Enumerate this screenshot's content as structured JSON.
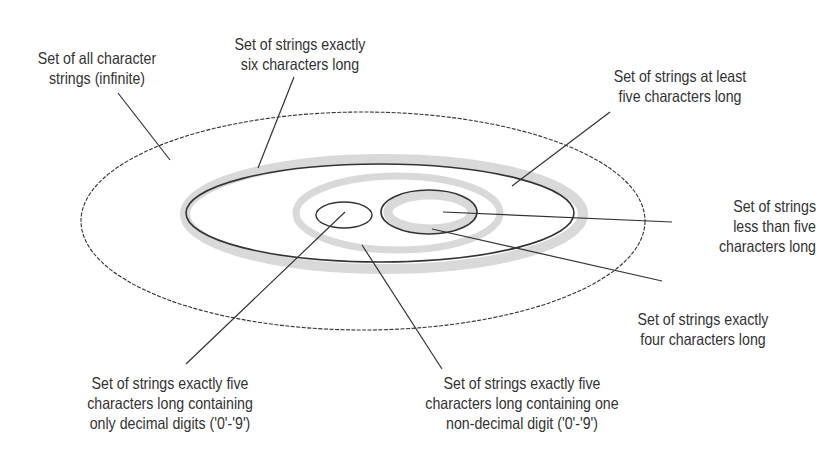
{
  "diagram": {
    "type": "nested-set-venn",
    "colors": {
      "background": "#ffffff",
      "stroke": "#333333",
      "band_gray": "#d9d9d9",
      "text": "#333333"
    },
    "labels": {
      "all_strings": [
        "Set of all character",
        "strings (infinite)"
      ],
      "six_chars": [
        "Set of strings exactly",
        "six characters long"
      ],
      "at_least_five": [
        "Set of strings at least",
        "five characters long"
      ],
      "less_than_five": [
        "Set of strings",
        "less than five",
        "characters long"
      ],
      "four_chars": [
        "Set of strings exactly",
        "four characters long"
      ],
      "five_digits": [
        "Set of strings exactly five",
        "characters long containing",
        "only decimal digits ('0'-'9')"
      ],
      "five_one_nondigit": [
        "Set of strings exactly five",
        "characters long containing one",
        "non-decimal digit ('0'-'9')"
      ]
    }
  }
}
